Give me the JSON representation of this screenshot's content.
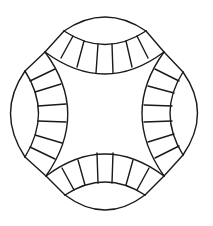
{
  "diagram": {
    "title": "",
    "type": "double-wedding-ring-quilt-block",
    "stroke_color": "#1a1a1a",
    "background_color": "#ffffff",
    "segments_per_arc": 7,
    "arcs": [
      "top",
      "right",
      "bottom",
      "left"
    ]
  }
}
